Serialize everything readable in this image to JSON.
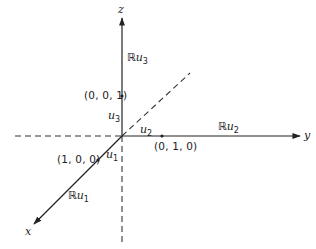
{
  "diagram": {
    "type": "3d-coordinate-axes",
    "axes": {
      "z": {
        "label": "z",
        "line_label_prefix": "ℝ",
        "line_label_var": "u",
        "line_label_sub": "3"
      },
      "y": {
        "label": "y",
        "line_label_prefix": "ℝ",
        "line_label_var": "u",
        "line_label_sub": "2"
      },
      "x": {
        "label": "x",
        "line_label_prefix": "ℝ",
        "line_label_var": "u",
        "line_label_sub": "1"
      }
    },
    "unit_vectors": {
      "u3": {
        "var": "u",
        "sub": "3",
        "point": "(0, 0, 1)"
      },
      "u2": {
        "var": "u",
        "sub": "2",
        "point": "(0, 1, 0)"
      },
      "u1": {
        "var": "u",
        "sub": "1",
        "point": "(1, 0, 0)"
      }
    },
    "colors": {
      "stroke": "#222222",
      "background": "#ffffff"
    }
  }
}
